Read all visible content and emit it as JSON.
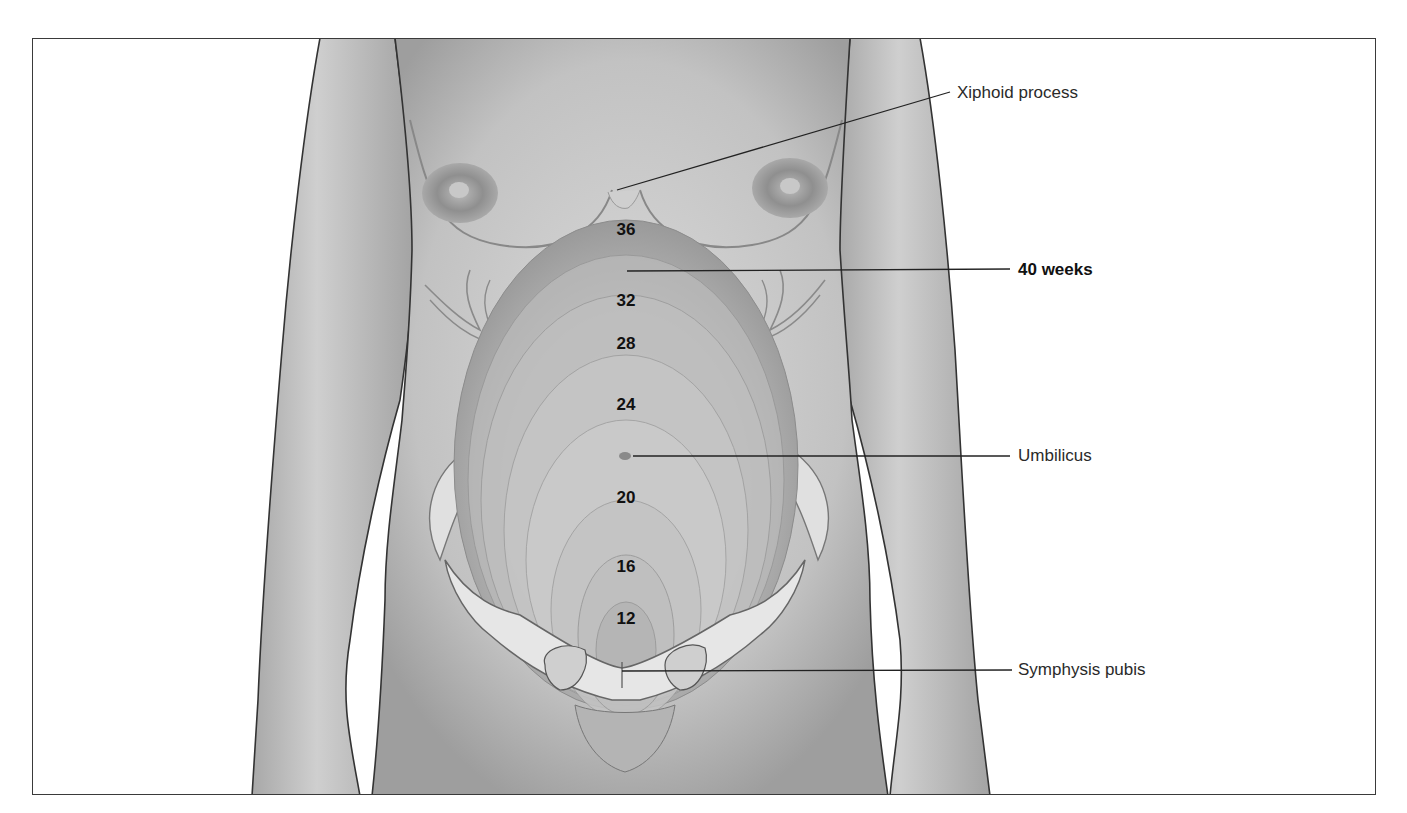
{
  "figure": {
    "frame_color": "#3a3a3a",
    "skin_color": "#c9c9c9",
    "uterus_color": "#b8b8b8",
    "bone_color": "#e2e2e2"
  },
  "labels": {
    "xiphoid": "Xiphoid process",
    "forty_weeks": "40 weeks",
    "umbilicus": "Umbilicus",
    "symphysis": "Symphysis pubis"
  },
  "weeks": [
    {
      "label": "36",
      "x": 626,
      "y": 221
    },
    {
      "label": "32",
      "x": 626,
      "y": 292
    },
    {
      "label": "28",
      "x": 626,
      "y": 335
    },
    {
      "label": "24",
      "x": 626,
      "y": 396
    },
    {
      "label": "20",
      "x": 626,
      "y": 489
    },
    {
      "label": "16",
      "x": 626,
      "y": 558
    },
    {
      "label": "12",
      "x": 626,
      "y": 610
    }
  ]
}
